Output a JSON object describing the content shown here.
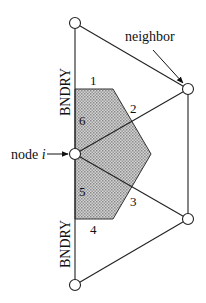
{
  "diagram": {
    "labels": {
      "neighbor": "neighbor",
      "node_prefix": "node ",
      "node_var": "i",
      "boundary_top": "BNDRY",
      "boundary_bottom": "BNDRY"
    },
    "face_numbers": [
      "1",
      "2",
      "3",
      "4",
      "5",
      "6"
    ],
    "colors": {
      "stroke": "#222222",
      "fill_shade": "#b8b8b8",
      "node_fill": "#ffffff"
    }
  }
}
